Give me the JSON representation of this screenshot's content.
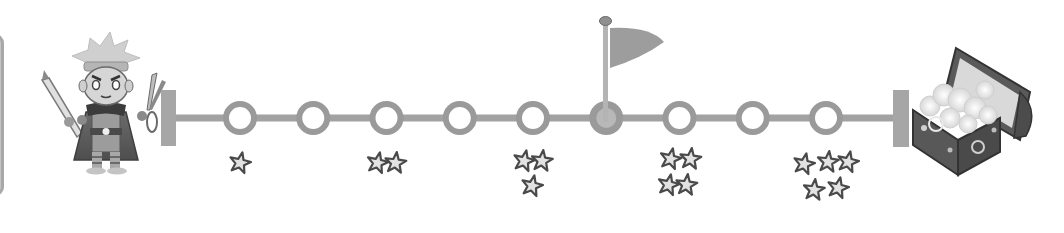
{
  "screen": {
    "title": "Level progress path",
    "theme": "grayscale"
  },
  "colors": {
    "track": "#a2a2a2",
    "node_ring": "#9a9a9a",
    "node_hole": "#ffffff",
    "star_fill": "#e2e2e2",
    "star_stroke": "#4a4a4a",
    "flag": "#9d9d9d",
    "pole": "#b4b4b4",
    "end_cap": "#a6a6a6",
    "chest_body": "#5a5a5a",
    "chest_lid_inner": "#d8d8d8",
    "treasure": "#f2f2f2"
  },
  "player": {
    "label": "Hero character",
    "left_item": "pencil",
    "right_item": "scissors"
  },
  "path": {
    "node_count": 9,
    "checkpoint_node": 5,
    "checkpoint_label": "Checkpoint flag",
    "goal_label": "Treasure chest",
    "nodes": [
      {
        "index": 1,
        "stars": 1
      },
      {
        "index": 2,
        "stars": 0
      },
      {
        "index": 3,
        "stars": 2
      },
      {
        "index": 4,
        "stars": 0
      },
      {
        "index": 5,
        "stars": 3
      },
      {
        "index": 6,
        "stars": 0,
        "checkpoint": true
      },
      {
        "index": 7,
        "stars": 4
      },
      {
        "index": 8,
        "stars": 0
      },
      {
        "index": 9,
        "stars": 5
      }
    ]
  }
}
